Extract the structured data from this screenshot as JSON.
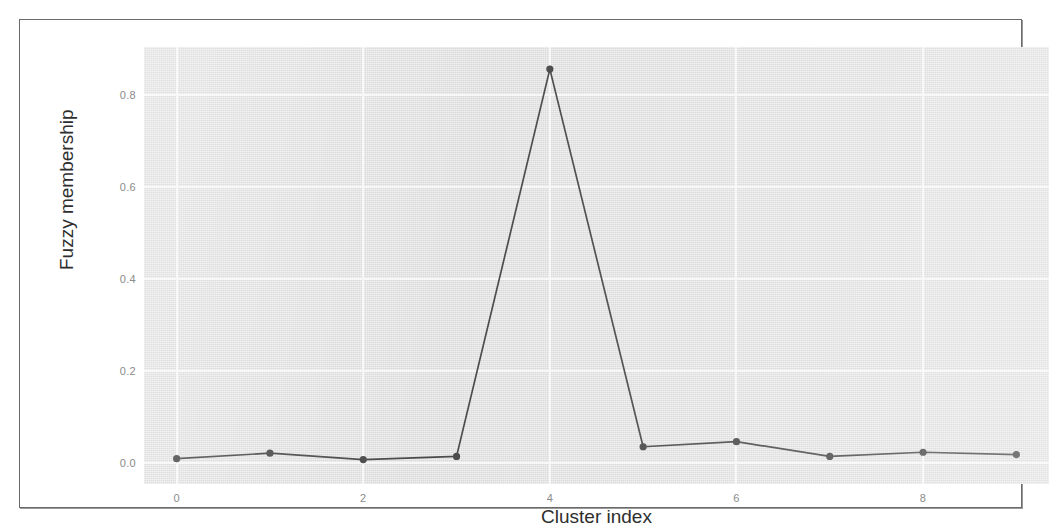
{
  "figure": {
    "artifact_name": "scan-smudge"
  },
  "chart_data": {
    "type": "line",
    "title": "",
    "xlabel": "Cluster index",
    "ylabel": "Fuzzy membership",
    "x": [
      0,
      1,
      2,
      3,
      4,
      5,
      6,
      7,
      8,
      9
    ],
    "values": [
      0.01,
      0.022,
      0.008,
      0.015,
      0.857,
      0.036,
      0.047,
      0.015,
      0.024,
      0.019
    ],
    "series": [
      {
        "name": "Fuzzy membership",
        "values": [
          0.01,
          0.022,
          0.008,
          0.015,
          0.857,
          0.036,
          0.047,
          0.015,
          0.024,
          0.019
        ]
      }
    ],
    "xlim": [
      -0.35,
      9.35
    ],
    "ylim": [
      -0.045,
      0.905
    ],
    "xticks": [
      0,
      2,
      4,
      6,
      8
    ],
    "xtick_labels": [
      "0",
      "2",
      "4",
      "6",
      "8"
    ],
    "yticks": [
      0.0,
      0.2,
      0.4,
      0.6,
      0.8
    ],
    "ytick_labels": [
      "0.0",
      "0.2",
      "0.4",
      "0.6",
      "0.8"
    ],
    "grid": true,
    "legend": null,
    "line_color": "#4a4a4a",
    "marker_color": "#4a4a4a",
    "marker": "circle",
    "panel_background": "#e2e2e2",
    "gridline_color": "#f7f7f7"
  }
}
